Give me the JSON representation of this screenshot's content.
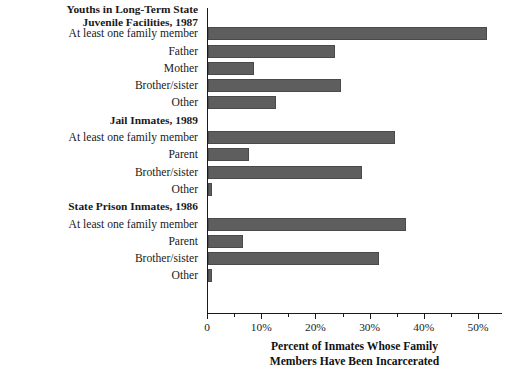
{
  "chart_data": {
    "type": "bar",
    "orientation": "horizontal",
    "title": "",
    "xlabel": "Percent of Inmates Whose Family Members Have Been Incarcerated",
    "ylabel": "",
    "xlim": [
      0,
      54
    ],
    "grid": false,
    "legend": null,
    "bar_color": "#5e5e5e",
    "axis_color": "#1a1a1a",
    "x_ticks": [
      {
        "value": 0,
        "label": "0",
        "major": true
      },
      {
        "value": 5,
        "label": "",
        "major": false
      },
      {
        "value": 10,
        "label": "10%",
        "major": true
      },
      {
        "value": 15,
        "label": "",
        "major": false
      },
      {
        "value": 20,
        "label": "20%",
        "major": true
      },
      {
        "value": 25,
        "label": "",
        "major": false
      },
      {
        "value": 30,
        "label": "30%",
        "major": true
      },
      {
        "value": 35,
        "label": "",
        "major": false
      },
      {
        "value": 40,
        "label": "40%",
        "major": true
      },
      {
        "value": 45,
        "label": "",
        "major": false
      },
      {
        "value": 50,
        "label": "50%",
        "major": true
      }
    ],
    "sections": [
      {
        "header": "Youths in Long-Term State Juvenile Facilities, 1987",
        "header_line1": "Youths in Long-Term State",
        "header_line2": "Juvenile Facilities, 1987",
        "categories": [
          "At least one family member",
          "Father",
          "Mother",
          "Brother/sister",
          "Other"
        ],
        "values": [
          51.5,
          23.5,
          8.5,
          24.5,
          12.5
        ]
      },
      {
        "header": "Jail Inmates, 1989",
        "header_line1": "Jail Inmates, 1989",
        "header_line2": "",
        "categories": [
          "At least one family member",
          "Parent",
          "Brother/sister",
          "Other"
        ],
        "values": [
          34.5,
          7.5,
          28.5,
          0.8
        ]
      },
      {
        "header": "State Prison Inmates, 1986",
        "header_line1": "State Prison Inmates, 1986",
        "header_line2": "",
        "categories": [
          "At least one family member",
          "Parent",
          "Brother/sister",
          "Other"
        ],
        "values": [
          36.5,
          6.5,
          31.5,
          0.7
        ]
      }
    ],
    "axis_title_line1": "Percent of Inmates Whose Family",
    "axis_title_line2": "Members Have Been Incarcerated"
  }
}
